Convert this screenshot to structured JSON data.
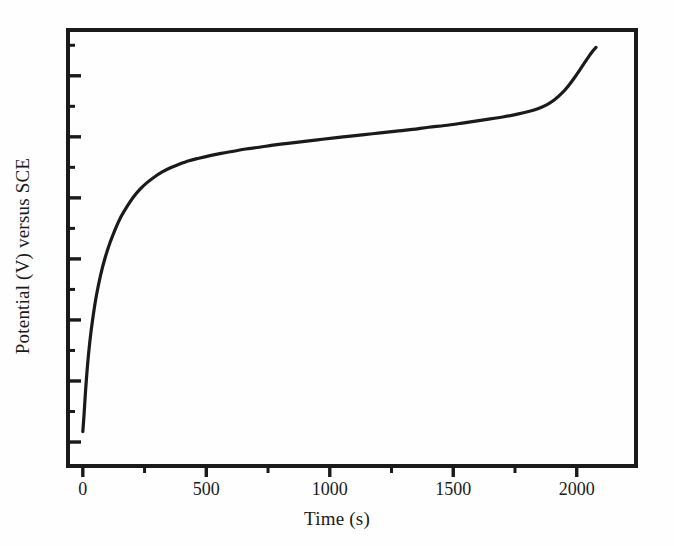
{
  "figure": {
    "background_color": "#fefefe",
    "ink_color": "#1a1a1a",
    "frame_color": "#1a1a1a"
  },
  "chart_data": {
    "type": "line",
    "title": "",
    "subtitle": "",
    "xlabel": "Time (s)",
    "ylabel": "Potential (V) versus SCE",
    "xlim": [
      -60,
      2240
    ],
    "ylim": [
      0,
      1
    ],
    "grid": false,
    "legend": null,
    "legend_position": "none",
    "x_major_ticks": [
      0,
      500,
      1000,
      1500,
      2000
    ],
    "x_major_tick_labels": [
      "0",
      "500",
      "1000",
      "1500",
      "2000"
    ],
    "x_minor_ticks": [
      250,
      750,
      1250,
      1750
    ],
    "y_major_ticks": [
      0.055,
      0.195,
      0.335,
      0.475,
      0.615,
      0.755,
      0.895
    ],
    "y_minor_ticks": [
      0.125,
      0.265,
      0.405,
      0.545,
      0.685,
      0.825,
      0.965
    ],
    "y_major_tick_labels": [],
    "series": [
      {
        "name": "chronopotentiogram",
        "line_color": "#1a1a1a",
        "line_width": 3.2,
        "x": [
          0,
          5,
          10,
          18,
          28,
          40,
          55,
          72,
          90,
          110,
          132,
          155,
          180,
          205,
          232,
          260,
          290,
          320,
          355,
          390,
          430,
          470,
          515,
          560,
          610,
          660,
          715,
          770,
          830,
          890,
          950,
          1010,
          1075,
          1140,
          1205,
          1270,
          1335,
          1400,
          1465,
          1530,
          1590,
          1650,
          1705,
          1760,
          1805,
          1845,
          1880,
          1910,
          1940,
          1965,
          1990,
          2012,
          2032,
          2050,
          2065,
          2078
        ],
        "y": [
          0.079,
          0.118,
          0.163,
          0.224,
          0.283,
          0.337,
          0.391,
          0.438,
          0.477,
          0.512,
          0.544,
          0.572,
          0.596,
          0.617,
          0.635,
          0.65,
          0.663,
          0.674,
          0.684,
          0.692,
          0.7,
          0.706,
          0.712,
          0.717,
          0.722,
          0.727,
          0.731,
          0.736,
          0.74,
          0.744,
          0.748,
          0.752,
          0.756,
          0.76,
          0.764,
          0.768,
          0.772,
          0.777,
          0.781,
          0.786,
          0.791,
          0.796,
          0.801,
          0.807,
          0.813,
          0.82,
          0.829,
          0.84,
          0.855,
          0.871,
          0.89,
          0.908,
          0.925,
          0.94,
          0.952,
          0.96
        ]
      }
    ],
    "annotations": []
  }
}
